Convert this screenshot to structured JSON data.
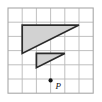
{
  "figure": {
    "canvas": {
      "width": 102,
      "height": 102,
      "background": "#ffffff"
    },
    "grid": {
      "origin_x": 8,
      "origin_y": 8,
      "cell_size": 14.2,
      "cols": 6,
      "rows": 6,
      "line_color": "#b9b9b9",
      "border_color": "#a8a8a8",
      "visible": true
    },
    "style": {
      "shape_fill": "#d2d2d2",
      "shape_stroke": "#2b2b2b",
      "point_color": "#161616"
    },
    "shapes": [
      {
        "name": "large-triangle",
        "type": "polygon",
        "grid_points": [
          [
            1,
            1.2
          ],
          [
            5,
            1.2
          ],
          [
            1,
            3.2
          ]
        ],
        "label": "Large triangle",
        "base_units": 4,
        "height_units": 2
      },
      {
        "name": "small-triangle",
        "type": "polygon",
        "grid_points": [
          [
            2,
            3.2
          ],
          [
            4,
            3.2
          ],
          [
            2,
            4.2
          ]
        ],
        "label": "Small triangle",
        "base_units": 2,
        "height_units": 1
      }
    ],
    "points": [
      {
        "name": "point-p",
        "label": "P",
        "grid_x": 3,
        "grid_y": 5.1,
        "radius": 2.1,
        "label_offset_x": 5,
        "label_offset_y": 9
      }
    ]
  }
}
